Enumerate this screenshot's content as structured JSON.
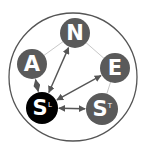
{
  "diagram": {
    "nodes": [
      {
        "id": "N",
        "label": "N",
        "sup": "",
        "fill": "#5a5a5a"
      },
      {
        "id": "A",
        "label": "A",
        "sup": "",
        "fill": "#5a5a5a"
      },
      {
        "id": "E",
        "label": "E",
        "sup": "",
        "fill": "#5a5a5a"
      },
      {
        "id": "SL",
        "label": "S",
        "sup": "L",
        "fill": "#000000"
      },
      {
        "id": "ST",
        "label": "S",
        "sup": "T",
        "fill": "#5a5a5a"
      }
    ],
    "pentagon_edges": [
      [
        "A",
        "N"
      ],
      [
        "N",
        "E"
      ],
      [
        "E",
        "ST"
      ],
      [
        "A",
        "SL"
      ],
      [
        "SL",
        "ST"
      ]
    ],
    "arrows": [
      {
        "from": "SL",
        "to": "A",
        "bidirectional": true
      },
      {
        "from": "SL",
        "to": "N",
        "bidirectional": true
      },
      {
        "from": "SL",
        "to": "E",
        "bidirectional": true
      },
      {
        "from": "SL",
        "to": "ST",
        "bidirectional": true
      }
    ],
    "colors": {
      "outline": "#555555",
      "pentagon": "#c8c8c8",
      "arrow": "#555555"
    }
  }
}
